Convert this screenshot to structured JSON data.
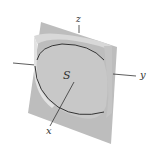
{
  "diagram": {
    "labels": {
      "z_axis": "z",
      "y_axis": "y",
      "x_axis": "x",
      "surface": "S"
    },
    "colors": {
      "plane": "#b9b9b9",
      "cylinder_outer": "#d6d6d6",
      "cylinder_inner": "#cfcfcf",
      "curve": "#222222",
      "axis": "#333333"
    }
  }
}
